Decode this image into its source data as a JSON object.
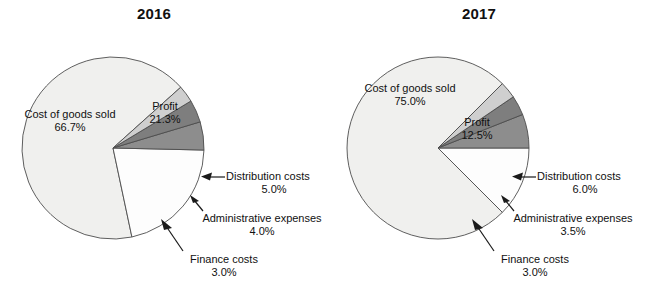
{
  "chart_data": [
    {
      "type": "pie",
      "title": "2016",
      "categories": [
        "Cost of goods sold",
        "Profit",
        "Distribution costs",
        "Administrative expenses",
        "Finance costs"
      ],
      "values": [
        66.7,
        21.3,
        5.0,
        4.0,
        3.0
      ],
      "value_labels": [
        "66.7%",
        "21.3%",
        "5.0%",
        "4.0%",
        "3.0%"
      ],
      "unit": "%",
      "legend": "none",
      "grid": false,
      "slice_colors": [
        "#f0f0ee",
        "#fdfdfd",
        "#8d8d8d",
        "#7e7e7e",
        "#cfcfcf"
      ],
      "slices": [
        {
          "name": "Cost of goods sold",
          "value": 66.7,
          "value_label": "66.7%",
          "color": "#f0f0ee",
          "start_deg": 78.0,
          "end_deg": 318.1,
          "labeled": "inside"
        },
        {
          "name": "Profit",
          "value": 21.3,
          "value_label": "21.3%",
          "color": "#fdfdfd",
          "start_deg": 1.3,
          "end_deg": 78.0,
          "labeled": "inside"
        },
        {
          "name": "Distribution costs",
          "value": 5.0,
          "value_label": "5.0%",
          "color": "#8d8d8d",
          "start_deg": 343.3,
          "end_deg": 1.3,
          "labeled": "callout"
        },
        {
          "name": "Administrative expenses",
          "value": 4.0,
          "value_label": "4.0%",
          "color": "#7e7e7e",
          "start_deg": 328.9,
          "end_deg": 343.3,
          "labeled": "callout"
        },
        {
          "name": "Finance costs",
          "value": 3.0,
          "value_label": "3.0%",
          "color": "#cfcfcf",
          "start_deg": 318.1,
          "end_deg": 328.9,
          "labeled": "callout"
        }
      ]
    },
    {
      "type": "pie",
      "title": "2017",
      "categories": [
        "Cost of goods sold",
        "Profit",
        "Distribution costs",
        "Administrative expenses",
        "Finance costs"
      ],
      "values": [
        75.0,
        12.5,
        6.0,
        3.5,
        3.0
      ],
      "value_labels": [
        "75.0%",
        "12.5%",
        "6.0%",
        "3.5%",
        "3.0%"
      ],
      "unit": "%",
      "legend": "none",
      "grid": false,
      "slice_colors": [
        "#f0f0ee",
        "#fdfdfd",
        "#8d8d8d",
        "#7e7e7e",
        "#cfcfcf"
      ],
      "slices": [
        {
          "name": "Cost of goods sold",
          "value": 75.0,
          "value_label": "75.0%",
          "color": "#f0f0ee",
          "start_deg": 45.0,
          "end_deg": 315.0,
          "labeled": "inside"
        },
        {
          "name": "Profit",
          "value": 12.5,
          "value_label": "12.5%",
          "color": "#fdfdfd",
          "start_deg": 0.0,
          "end_deg": 45.0,
          "labeled": "inside"
        },
        {
          "name": "Distribution costs",
          "value": 6.0,
          "value_label": "6.0%",
          "color": "#8d8d8d",
          "start_deg": 338.4,
          "end_deg": 360.0,
          "labeled": "callout"
        },
        {
          "name": "Administrative expenses",
          "value": 3.5,
          "value_label": "3.5%",
          "color": "#7e7e7e",
          "start_deg": 325.8,
          "end_deg": 338.4,
          "labeled": "callout"
        },
        {
          "name": "Finance costs",
          "value": 3.0,
          "value_label": "3.0%",
          "color": "#cfcfcf",
          "start_deg": 315.0,
          "end_deg": 325.8,
          "labeled": "callout"
        }
      ]
    }
  ],
  "charts": {
    "left": {
      "title": "2016",
      "labels": {
        "cost_of_goods_sold": {
          "name": "Cost of goods sold",
          "value": "66.7%"
        },
        "profit": {
          "name": "Profit",
          "value": "21.3%"
        },
        "distribution_costs": {
          "name": "Distribution costs",
          "value": "5.0%"
        },
        "administrative_expenses": {
          "name": "Administrative expenses",
          "value": "4.0%"
        },
        "finance_costs": {
          "name": "Finance costs",
          "value": "3.0%"
        }
      }
    },
    "right": {
      "title": "2017",
      "labels": {
        "cost_of_goods_sold": {
          "name": "Cost of goods sold",
          "value": "75.0%"
        },
        "profit": {
          "name": "Profit",
          "value": "12.5%"
        },
        "distribution_costs": {
          "name": "Distribution costs",
          "value": "6.0%"
        },
        "administrative_expenses": {
          "name": "Administrative expenses",
          "value": "3.5%"
        },
        "finance_costs": {
          "name": "Finance costs",
          "value": "3.0%"
        }
      }
    }
  },
  "colors": {
    "cost_of_goods_sold": "#f0f0ee",
    "profit": "#fdfdfd",
    "distribution_costs": "#8d8d8d",
    "administrative_expenses": "#7e7e7e",
    "finance_costs": "#cfcfcf",
    "outline": "#4d4d4d",
    "text": "#111111",
    "background": "#ffffff"
  }
}
